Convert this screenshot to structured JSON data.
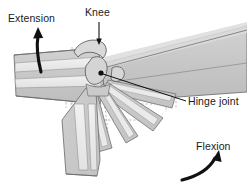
{
  "figure": {
    "labels": {
      "extension": "Extension",
      "knee": "Knee",
      "hinge_joint": "Hinge joint",
      "flexion": "Flexion"
    },
    "colors": {
      "band_fill": "#c9c9c9",
      "band_fill_light": "#d8d8d8",
      "stripe_fill": "#ececec",
      "outline": "#6e6e6e",
      "dashed": "#9a9a9a",
      "arrow": "#111111",
      "leader": "#111111",
      "text": "#1a1a1a",
      "background": "#ffffff"
    },
    "annotations": [
      {
        "name": "extension",
        "label": "Extension",
        "text_x": 8,
        "text_y": 22,
        "marker": "curved-arrow-up-left"
      },
      {
        "name": "knee",
        "label": "Knee",
        "text_x": 85,
        "text_y": 16,
        "marker": "straight-leader-down"
      },
      {
        "name": "hinge-joint",
        "label": "Hinge joint",
        "text_x": 188,
        "text_y": 104,
        "marker": "straight-leader-left"
      },
      {
        "name": "flexion",
        "label": "Flexion",
        "text_x": 196,
        "text_y": 150,
        "marker": "curved-arrow-up-right"
      }
    ],
    "pivot": {
      "x": 101,
      "y": 73,
      "radius": 2.6
    }
  }
}
